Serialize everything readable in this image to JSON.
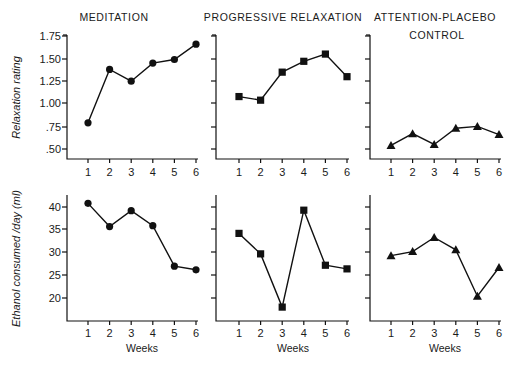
{
  "chart_data": {
    "type": "line",
    "layout": "2x3 small multiples",
    "panel_titles": [
      "MEDITATION",
      "PROGRESSIVE RELAXATION",
      "ATTENTION-PLACEBO CONTROL"
    ],
    "x": [
      1,
      2,
      3,
      4,
      5,
      6
    ],
    "xlabel": "Weeks",
    "rows": [
      {
        "ylabel": "Relaxation rating",
        "yticks": [
          ".50",
          ".75",
          "1.00",
          "1.25",
          "1.50",
          "1.75"
        ],
        "ylim": [
          0.4,
          1.75
        ],
        "series": [
          {
            "name": "Meditation",
            "marker": "circle",
            "values": [
              0.79,
              1.38,
              1.25,
              1.45,
              1.49,
              1.66
            ]
          },
          {
            "name": "Progressive Relaxation",
            "marker": "square",
            "values": [
              1.08,
              1.04,
              1.35,
              1.47,
              1.55,
              1.3
            ]
          },
          {
            "name": "Attention-Placebo Control",
            "marker": "triangle",
            "values": [
              0.54,
              0.67,
              0.55,
              0.73,
              0.75,
              0.66
            ]
          }
        ]
      },
      {
        "ylabel": "Ethanol consumed /day (ml)",
        "yticks": [
          "20",
          "25",
          "30",
          "35",
          "40"
        ],
        "ylim": [
          15,
          42
        ],
        "series": [
          {
            "name": "Meditation",
            "marker": "circle",
            "values": [
              40.8,
              35.7,
              39.2,
              35.9,
              27.0,
              26.2
            ]
          },
          {
            "name": "Progressive Relaxation",
            "marker": "square",
            "values": [
              34.2,
              29.7,
              18.0,
              39.3,
              27.2,
              26.4
            ]
          },
          {
            "name": "Attention-Placebo Control",
            "marker": "triangle",
            "values": [
              29.3,
              30.2,
              33.3,
              30.6,
              20.4,
              26.7
            ]
          }
        ]
      }
    ],
    "grid": false,
    "legend": "none"
  }
}
